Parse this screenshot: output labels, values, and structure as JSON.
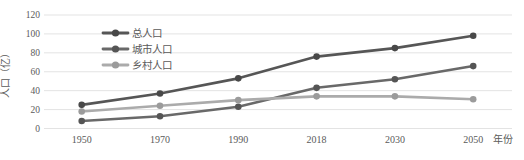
{
  "chart_data": {
    "type": "line",
    "title": "",
    "categories": [
      "1950",
      "1970",
      "1990",
      "2018",
      "2030",
      "2050"
    ],
    "series": [
      {
        "name": "总人口",
        "values": [
          25,
          37,
          53,
          76,
          85,
          98
        ],
        "color": "#565656",
        "marker_color": "#484848"
      },
      {
        "name": "城市人口",
        "values": [
          8,
          13,
          23,
          43,
          52,
          66
        ],
        "color": "#696969",
        "marker_color": "#555555"
      },
      {
        "name": "乡村人口",
        "values": [
          18,
          24,
          30,
          34,
          34,
          31
        ],
        "color": "#ababab",
        "marker_color": "#9b9b9b"
      }
    ],
    "xlabel": "年份",
    "ylabel": "人口（亿）",
    "ylim": [
      0,
      120
    ],
    "ytick_step": 20,
    "yticks": [
      0,
      20,
      40,
      60,
      80,
      100,
      120
    ],
    "grid": true,
    "legend_position": "top-left",
    "axis_text_color": "#5a5a5a",
    "grid_color": "#e3e3e3",
    "background_color": "#ffffff"
  }
}
